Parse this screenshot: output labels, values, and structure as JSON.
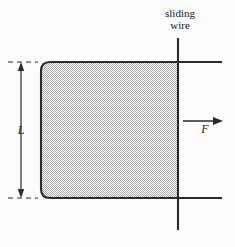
{
  "figure": {
    "background_color": "#fcfcfc",
    "line_color": "#2b2b2b",
    "fill_color": "#c9c9c9",
    "labels": {
      "sliding_wire_line1": "sliding",
      "sliding_wire_line2": "wire",
      "length": "L",
      "force": "F"
    },
    "geometry": {
      "loop_left_x": 41,
      "loop_right_x": 178,
      "rail_top_y": 62,
      "rail_bottom_y": 198,
      "rail_end_x": 222,
      "wire_x": 178,
      "wire_top_y": 38,
      "wire_bottom_y": 230,
      "corner_radius": 9,
      "dimension_x": 21,
      "force_arrow_y": 121,
      "force_arrow_x1": 183,
      "force_arrow_x2": 222
    }
  }
}
